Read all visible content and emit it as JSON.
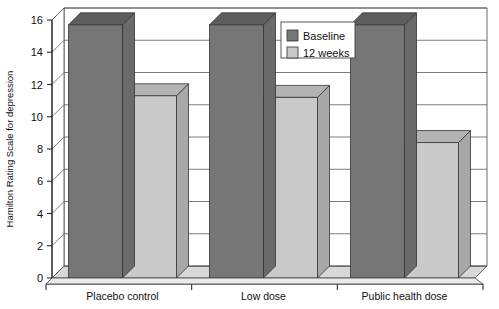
{
  "chart_data": {
    "type": "bar",
    "title": "",
    "subtitle": "",
    "xlabel": "",
    "ylabel": "Hamilton Rating Scale for depression",
    "categories": [
      "Placebo control",
      "Low dose",
      "Public health dose"
    ],
    "series": [
      {
        "name": "Baseline",
        "values": [
          15.7,
          15.7,
          15.7
        ],
        "color": "#767676"
      },
      {
        "name": "12 weeks",
        "values": [
          11.3,
          11.2,
          8.4
        ],
        "color": "#c9c9c9"
      }
    ],
    "ylim": [
      0,
      16
    ],
    "ytick_values": [
      0,
      2,
      4,
      6,
      8,
      10,
      12,
      14,
      16
    ],
    "ytick_labels": [
      "0",
      "2",
      "4",
      "6",
      "8",
      "10",
      "12",
      "14",
      "16"
    ],
    "grid": true,
    "grid_axis": "y",
    "legend_position": "top-right",
    "style": "3d-bar",
    "legend_entries": [
      {
        "label": "Baseline",
        "swatch_color": "#767676"
      },
      {
        "label": "12 weeks",
        "swatch_color": "#c9c9c9"
      }
    ],
    "annotations": []
  },
  "colors": {
    "baseline": "#767676",
    "twelve_weeks": "#c9c9c9",
    "baseline_top": "#5e5e5e",
    "baseline_side": "#6a6a6a",
    "weeks_top": "#b3b3b3",
    "weeks_side": "#a8a8a8",
    "axis": "#2b2b2b",
    "grid": "#5a5a5a",
    "floor": "#d8d8d8",
    "background": "#ffffff"
  }
}
